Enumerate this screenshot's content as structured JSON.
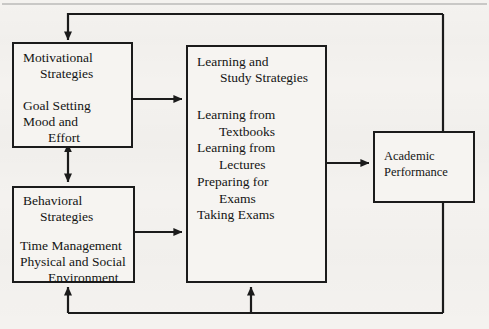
{
  "diagram": {
    "type": "block-flow-diagram",
    "colors": {
      "background": "#f4f2ef",
      "box_fill": "#f6f4f1",
      "stroke": "#1b1b1b",
      "text": "#141414",
      "page_rule": "#9a9a9a"
    },
    "nodes": [
      {
        "id": "motivational",
        "heading_line1": "Motivational",
        "heading_line2": "Strategies",
        "body_line1": "Goal Setting",
        "body_line2": "Mood and",
        "body_line3": "Effort"
      },
      {
        "id": "behavioral",
        "heading_line1": "Behavioral",
        "heading_line2": "Strategies",
        "body_line1": "Time Management",
        "body_line2": "Physical and Social",
        "body_line3": "Environment"
      },
      {
        "id": "learning",
        "heading_line1": "Learning and",
        "heading_line2": "Study Strategies",
        "body_line1": "Learning from",
        "body_line2": "Textbooks",
        "body_line3": "Learning from",
        "body_line4": "Lectures",
        "body_line5": "Preparing for",
        "body_line6": "Exams",
        "body_line7": "Taking Exams"
      },
      {
        "id": "academic",
        "heading_line1": "Academic",
        "heading_line2": "Performance"
      }
    ],
    "connectors": [
      {
        "id": "motivational-to-learning",
        "from": "motivational",
        "to": "learning",
        "style": "single-arrow",
        "direction": "right"
      },
      {
        "id": "behavioral-to-learning",
        "from": "behavioral",
        "to": "learning",
        "style": "single-arrow",
        "direction": "right"
      },
      {
        "id": "motivational-behavioral-link",
        "from": "motivational",
        "to": "behavioral",
        "style": "double-arrow",
        "direction": "vertical"
      },
      {
        "id": "learning-to-academic",
        "from": "learning",
        "to": "academic",
        "style": "single-arrow",
        "direction": "right"
      },
      {
        "id": "academic-feedback-top",
        "from": "academic",
        "to": "motivational",
        "style": "feedback-loop",
        "direction": "up-left-down"
      },
      {
        "id": "academic-feedback-bottom-behavioral",
        "from": "academic",
        "to": "behavioral",
        "style": "feedback-loop",
        "direction": "down-left-up"
      },
      {
        "id": "academic-feedback-bottom-learning",
        "from": "academic",
        "to": "learning",
        "style": "feedback-loop",
        "direction": "down-left-up"
      }
    ]
  }
}
